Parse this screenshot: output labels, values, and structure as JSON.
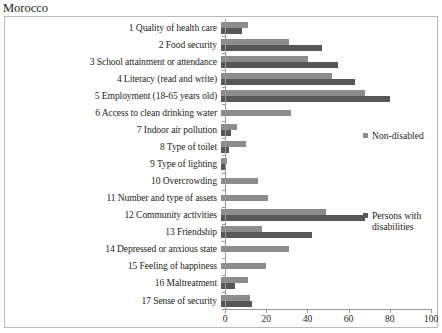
{
  "chart_title": "Morocco",
  "legend": {
    "position": "inside-right",
    "items": [
      {
        "label": "Non-disabled",
        "color": "#8c8c8c",
        "key": "non_disabled"
      },
      {
        "label": "Persons with disabilities",
        "color": "#575757",
        "key": "disabled"
      }
    ]
  },
  "axis": {
    "x_ticks": [
      "0",
      "20",
      "40",
      "60",
      "80",
      "100"
    ],
    "x_min": 0,
    "x_max": 100
  },
  "chart_data": {
    "type": "bar",
    "orientation": "horizontal",
    "title": "Morocco",
    "xlabel": "",
    "ylabel": "",
    "xlim": [
      0,
      100
    ],
    "grid": false,
    "legend_position": "inside-right",
    "categories": [
      "1 Quality of health care",
      "2 Food security",
      "3 School attainment or attendance",
      "4 Literacy (read and write)",
      "5 Employment  (18-65 years old)",
      "6 Access to clean drinking water",
      "7 Indoor air pollution",
      "8 Type of toilet",
      "9 Type of lighting",
      "10 Overcrowding",
      "11 Number and type of assets",
      "12 Community activities",
      "13 Friendship",
      "14 Depressed or anxious state",
      "15 Feeling of happiness",
      "16 Maltreatment",
      "17 Sense of security"
    ],
    "series": [
      {
        "name": "Non-disabled",
        "color": "#8c8c8c",
        "values": [
          13,
          33,
          42,
          54,
          70,
          34,
          8,
          12,
          3,
          18,
          23,
          51,
          20,
          33,
          22,
          13,
          14
        ]
      },
      {
        "name": "Persons with disabilities",
        "color": "#575757",
        "values": [
          10,
          49,
          57,
          65,
          82,
          0,
          5,
          4,
          2,
          0,
          0,
          70,
          44,
          0,
          0,
          7,
          15
        ]
      }
    ]
  }
}
